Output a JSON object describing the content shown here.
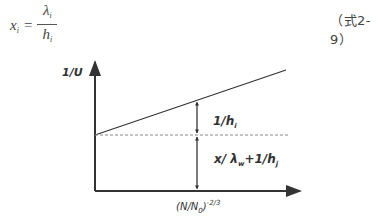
{
  "equation": {
    "lhs_var": "x",
    "lhs_sub": "i",
    "equals": "=",
    "numerator_var": "λ",
    "numerator_sub": "i",
    "denominator_var": "h",
    "denominator_sub": "i",
    "number": "（式2-9）"
  },
  "diagram": {
    "y_axis_label": "1/U",
    "x_axis_label": "(N/N",
    "x_axis_label_sub": "0",
    "x_axis_label_tail": ")",
    "x_axis_label_sup": "-2/3",
    "upper_segment_label": "1/h",
    "upper_segment_label_sub": "i",
    "lower_segment_label_a": "x/ λ",
    "lower_segment_label_a_sub": "w",
    "lower_segment_label_b": "+1/h",
    "lower_segment_label_b_sub": "j",
    "colors": {
      "line": "#333333",
      "dashed": "#888888"
    }
  }
}
